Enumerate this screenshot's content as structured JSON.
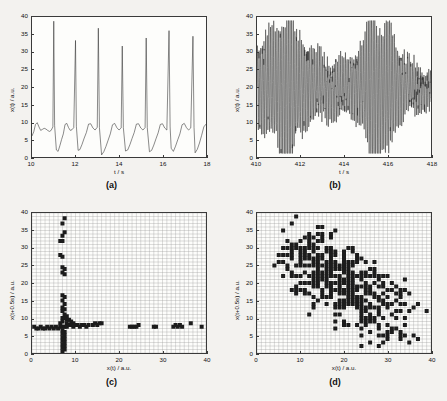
{
  "figure": {
    "panels": [
      {
        "id": "a",
        "caption": "(a)",
        "xlabel": "t / s",
        "ylabel": "x(t) / a.u.",
        "xticks": [
          "10",
          "12",
          "14",
          "16",
          "18"
        ],
        "yticks": [
          "0",
          "5",
          "10",
          "15",
          "20",
          "25",
          "30",
          "35",
          "40"
        ]
      },
      {
        "id": "b",
        "caption": "(b)",
        "xlabel": "t / s",
        "ylabel": "x(t) / a.u.",
        "xticks": [
          "410",
          "412",
          "414",
          "416",
          "418"
        ],
        "yticks": [
          "0",
          "5",
          "10",
          "15",
          "20",
          "25",
          "30",
          "35",
          "40"
        ]
      },
      {
        "id": "c",
        "caption": "(c)",
        "xlabel": "x(t) / a.u.",
        "ylabel": "x(t+0.5s) / a.u.",
        "xticks": [
          "0",
          "10",
          "20",
          "30",
          "40"
        ],
        "yticks": [
          "0",
          "5",
          "10",
          "15",
          "20",
          "25",
          "30",
          "35",
          "40"
        ]
      },
      {
        "id": "d",
        "caption": "(d)",
        "xlabel": "x(t) / a.u.",
        "ylabel": "x(t+0.5s) / a.u.",
        "xticks": [
          "0",
          "10",
          "20",
          "30",
          "40"
        ],
        "yticks": [
          "0",
          "5",
          "10",
          "15",
          "20",
          "25",
          "30",
          "35",
          "40"
        ]
      }
    ]
  },
  "chart_data": [
    {
      "type": "line",
      "panel": "a",
      "title": "(a)",
      "xlabel": "t / s",
      "ylabel": "x(t) / a.u.",
      "xlim": [
        10,
        18
      ],
      "ylim": [
        0,
        40
      ],
      "xticks": [
        10,
        12,
        14,
        16,
        18
      ],
      "yticks": [
        0,
        5,
        10,
        15,
        20,
        25,
        30,
        35,
        40
      ],
      "grid": false,
      "description": "Periodic spiking time series: large narrow spikes to 32-39 a.u. approximately every 1.1 s, separated by a low-amplitude relaxation baseline oscillating between 1 and 10 a.u.",
      "spike_times": [
        11.0,
        12.0,
        13.05,
        14.15,
        15.25,
        16.3,
        17.4
      ],
      "spike_heights": [
        38.8,
        33.3,
        36.8,
        31.7,
        34.0,
        36.1,
        34.5
      ],
      "baseline_range": [
        1.0,
        10.0
      ],
      "x": [
        10.0,
        10.08,
        10.16,
        10.24,
        10.32,
        10.4,
        10.48,
        10.56,
        10.64,
        10.72,
        10.8,
        10.88,
        10.96,
        11.0,
        11.04,
        11.12,
        11.2,
        11.28,
        11.36,
        11.44,
        11.52,
        11.6,
        11.68,
        11.76,
        11.84,
        11.92,
        12.0,
        12.04,
        12.12,
        12.2,
        12.3,
        12.4,
        12.5,
        12.6,
        12.7,
        12.8,
        12.9,
        13.0,
        13.05,
        13.1,
        13.2,
        13.3,
        13.4,
        13.5,
        13.6,
        13.7,
        13.8,
        13.9,
        14.0,
        14.1,
        14.15,
        14.2,
        14.3,
        14.4,
        14.5,
        14.6,
        14.7,
        14.8,
        14.9,
        15.0,
        15.1,
        15.2,
        15.25,
        15.3,
        15.4,
        15.5,
        15.6,
        15.7,
        15.8,
        15.9,
        16.0,
        16.1,
        16.2,
        16.3,
        16.35,
        16.4,
        16.5,
        16.6,
        16.7,
        16.8,
        16.9,
        17.0,
        17.1,
        17.2,
        17.3,
        17.4,
        17.45,
        17.5,
        17.6,
        17.7,
        17.8,
        17.9,
        18.0
      ],
      "y": [
        6.0,
        7.2,
        9.3,
        9.8,
        8.6,
        7.6,
        7.9,
        8.2,
        8.0,
        7.6,
        7.3,
        7.6,
        8.6,
        38.8,
        9.0,
        2.0,
        1.6,
        3.2,
        5.0,
        6.6,
        9.3,
        9.6,
        8.4,
        7.6,
        7.8,
        8.4,
        33.3,
        8.8,
        1.9,
        2.1,
        3.6,
        5.4,
        7.0,
        9.4,
        9.5,
        8.3,
        7.7,
        8.5,
        36.8,
        8.4,
        0.6,
        1.5,
        3.0,
        4.8,
        6.6,
        9.2,
        9.6,
        8.4,
        7.7,
        8.3,
        31.7,
        8.4,
        1.7,
        2.0,
        3.5,
        5.3,
        7.0,
        9.4,
        9.5,
        8.3,
        7.7,
        8.4,
        34.0,
        8.4,
        1.5,
        1.9,
        3.4,
        5.2,
        6.9,
        9.3,
        9.5,
        8.3,
        7.7,
        36.1,
        8.6,
        2.5,
        1.6,
        3.1,
        4.9,
        6.6,
        9.2,
        9.6,
        8.4,
        7.7,
        8.3,
        34.5,
        8.4,
        1.2,
        2.2,
        4.0,
        6.2,
        8.6,
        9.4
      ]
    },
    {
      "type": "line",
      "panel": "b",
      "title": "(b)",
      "xlabel": "t / s",
      "ylabel": "x(t) / a.u.",
      "xlim": [
        410,
        418
      ],
      "ylim": [
        0,
        40
      ],
      "xticks": [
        410,
        412,
        414,
        416,
        418
      ],
      "yticks": [
        0,
        5,
        10,
        15,
        20,
        25,
        30,
        35,
        40
      ],
      "grid": false,
      "description": "Dense irregular high-frequency oscillation about a mean of roughly 20 a.u.; amplitude fluctuates chaotically, envelope between about 1 and 39 a.u., with the largest bursts near t = 415.3 and t = 416.",
      "mean_level": 20,
      "envelope_min": 1,
      "envelope_max": 39,
      "approx_oscillation_period_s": 0.075,
      "burst_times": [
        411.4,
        415.3,
        416.0
      ],
      "burst_peaks": [
        36.0,
        39.0,
        36.5
      ]
    },
    {
      "type": "scatter",
      "panel": "c",
      "title": "(c)",
      "xlabel": "x(t) / a.u.",
      "ylabel": "x(t+0.5s) / a.u.",
      "xlim": [
        0,
        40
      ],
      "ylim": [
        0,
        40
      ],
      "xticks": [
        0,
        10,
        20,
        30,
        40
      ],
      "yticks": [
        0,
        5,
        10,
        15,
        20,
        25,
        30,
        35,
        40
      ],
      "grid": true,
      "marker": "filled-square",
      "description": "Return map of the periodic spiking signal: a sparse cross-shaped structure. A vertical branch sits at x approximately 7 spanning y from 0 to 39, and a horizontal branch sits at y approximately 7.5 spanning x from 0 to 39.",
      "points": [
        [
          7.5,
          38.5
        ],
        [
          7.0,
          37.0
        ],
        [
          7.5,
          34.5
        ],
        [
          7.0,
          33.5
        ],
        [
          6.5,
          32.0
        ],
        [
          7.0,
          32.0
        ],
        [
          6.5,
          28.0
        ],
        [
          7.0,
          27.5
        ],
        [
          7.0,
          24.5
        ],
        [
          7.5,
          24.0
        ],
        [
          7.0,
          23.0
        ],
        [
          7.5,
          22.5
        ],
        [
          7.0,
          16.5
        ],
        [
          7.5,
          16.0
        ],
        [
          7.0,
          15.0
        ],
        [
          7.5,
          14.0
        ],
        [
          7.0,
          13.0
        ],
        [
          7.5,
          12.5
        ],
        [
          7.0,
          12.0
        ],
        [
          7.5,
          11.0
        ],
        [
          8.0,
          10.5
        ],
        [
          7.0,
          10.0
        ],
        [
          7.5,
          10.0
        ],
        [
          8.0,
          9.5
        ],
        [
          8.5,
          9.5
        ],
        [
          9.0,
          9.0
        ],
        [
          7.0,
          9.0
        ],
        [
          6.5,
          8.5
        ],
        [
          8.0,
          8.5
        ],
        [
          9.5,
          8.5
        ],
        [
          0.5,
          7.5
        ],
        [
          1.0,
          7.0
        ],
        [
          1.5,
          7.0
        ],
        [
          2.0,
          7.5
        ],
        [
          2.5,
          7.0
        ],
        [
          3.0,
          7.0
        ],
        [
          3.5,
          7.5
        ],
        [
          4.0,
          7.0
        ],
        [
          4.5,
          7.5
        ],
        [
          5.0,
          7.0
        ],
        [
          5.5,
          7.5
        ],
        [
          6.0,
          7.0
        ],
        [
          6.5,
          7.5
        ],
        [
          7.0,
          7.5
        ],
        [
          7.5,
          7.5
        ],
        [
          8.0,
          7.5
        ],
        [
          8.5,
          8.0
        ],
        [
          9.0,
          8.0
        ],
        [
          9.5,
          7.5
        ],
        [
          10.0,
          8.0
        ],
        [
          10.5,
          8.0
        ],
        [
          11.0,
          7.5
        ],
        [
          11.5,
          8.0
        ],
        [
          12.0,
          8.0
        ],
        [
          12.5,
          7.5
        ],
        [
          13.0,
          8.0
        ],
        [
          14.0,
          8.0
        ],
        [
          14.5,
          8.5
        ],
        [
          15.0,
          8.0
        ],
        [
          15.5,
          8.5
        ],
        [
          16.0,
          8.5
        ],
        [
          7.0,
          6.5
        ],
        [
          7.5,
          6.0
        ],
        [
          7.0,
          5.5
        ],
        [
          7.5,
          5.0
        ],
        [
          7.0,
          4.5
        ],
        [
          7.5,
          4.0
        ],
        [
          7.0,
          3.5
        ],
        [
          7.5,
          3.0
        ],
        [
          7.0,
          2.5
        ],
        [
          7.5,
          2.0
        ],
        [
          7.0,
          1.5
        ],
        [
          7.5,
          1.0
        ],
        [
          7.0,
          0.5
        ],
        [
          22.5,
          7.5
        ],
        [
          23.0,
          7.5
        ],
        [
          23.5,
          7.5
        ],
        [
          24.0,
          7.5
        ],
        [
          24.5,
          8.0
        ],
        [
          28.0,
          7.5
        ],
        [
          28.5,
          7.5
        ],
        [
          32.5,
          7.5
        ],
        [
          33.0,
          8.0
        ],
        [
          33.5,
          7.5
        ],
        [
          34.0,
          8.0
        ],
        [
          34.5,
          7.5
        ],
        [
          36.5,
          8.5
        ],
        [
          39.0,
          7.5
        ]
      ]
    },
    {
      "type": "scatter",
      "panel": "d",
      "title": "(d)",
      "xlabel": "x(t) / a.u.",
      "ylabel": "x(t+0.5s) / a.u.",
      "xlim": [
        0,
        40
      ],
      "ylim": [
        0,
        40
      ],
      "xticks": [
        0,
        10,
        20,
        30,
        40
      ],
      "yticks": [
        0,
        5,
        10,
        15,
        20,
        25,
        30,
        35,
        40
      ],
      "grid": true,
      "marker": "filled-square",
      "description": "Return map of the chaotic signal: a broad diffuse cloud of roughly 330 points filling the plane with a clear negative correlation, running from upper-left (low x, high y) to lower-right (high x, low y).",
      "n_points": 330,
      "correlation": "negative",
      "cloud_x_range": [
        0,
        40
      ],
      "cloud_y_range": [
        0,
        40
      ]
    }
  ]
}
